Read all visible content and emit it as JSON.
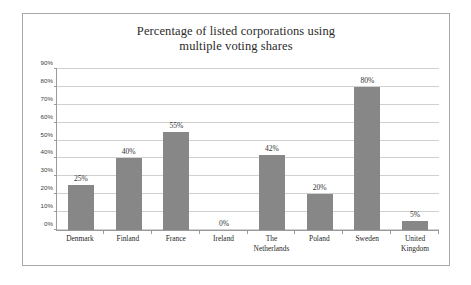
{
  "chart_data": {
    "type": "bar",
    "title": "Percentage of listed corporations using multiple voting shares",
    "title_lines": [
      "Percentage of listed corporations using",
      "multiple voting shares"
    ],
    "categories": [
      "Denmark",
      "Finland",
      "France",
      "Ireland",
      "The Netherlands",
      "Poland",
      "Sweden",
      "United Kingdom"
    ],
    "category_lines": [
      [
        "Denmark"
      ],
      [
        "Finland"
      ],
      [
        "France"
      ],
      [
        "Ireland"
      ],
      [
        "The",
        "Netherlands"
      ],
      [
        "Poland"
      ],
      [
        "Sweden"
      ],
      [
        "United",
        "Kingdom"
      ]
    ],
    "values": [
      25,
      40,
      55,
      0,
      42,
      20,
      80,
      5
    ],
    "data_labels": [
      "25%",
      "40%",
      "55%",
      "0%",
      "42%",
      "20%",
      "80%",
      "5%"
    ],
    "xlabel": "",
    "ylabel": "",
    "ylim": [
      0,
      90
    ],
    "ytick_values": [
      0,
      10,
      20,
      30,
      40,
      50,
      60,
      70,
      80,
      90
    ],
    "ytick_labels": [
      "0%",
      "10%",
      "20%",
      "30%",
      "40%",
      "50%",
      "60%",
      "70%",
      "80%",
      "90%"
    ],
    "grid": true,
    "legend": false,
    "bar_color": "#878787",
    "gridline_color": "#d0d0d0",
    "axis_color": "#9a9a9a",
    "text_color": "#2b2b2b",
    "background": "#ffffff"
  }
}
